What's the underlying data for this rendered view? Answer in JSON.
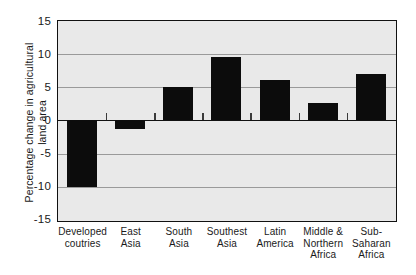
{
  "chart_data": {
    "type": "bar",
    "title": "",
    "subtitle": "",
    "xlabel": "",
    "ylabel": "Percentage change in agricultural\nland area",
    "categories": [
      "Developed\ncoutries",
      "East\nAsia",
      "South\nAsia",
      "Southest\nAsia",
      "Latin\nAmerica",
      "Middle &\nNorthern\nAfrica",
      "Sub-\nSaharan\nAfrica"
    ],
    "values": [
      -10,
      -1.3,
      5,
      9.5,
      6.1,
      2.6,
      7
    ],
    "ylim": [
      -15,
      15
    ],
    "yticks": [
      "15",
      "10",
      "5",
      "0",
      "-5",
      "-10",
      "-15"
    ],
    "ytick_values": [
      15,
      10,
      5,
      0,
      -5,
      -10,
      -15
    ],
    "grid": true,
    "legend": "none",
    "bar_color": "#0c0c0c",
    "plot_background": "#e9e9e9",
    "gridline_color": "#9a9a9a",
    "axis_color": "#111111"
  }
}
